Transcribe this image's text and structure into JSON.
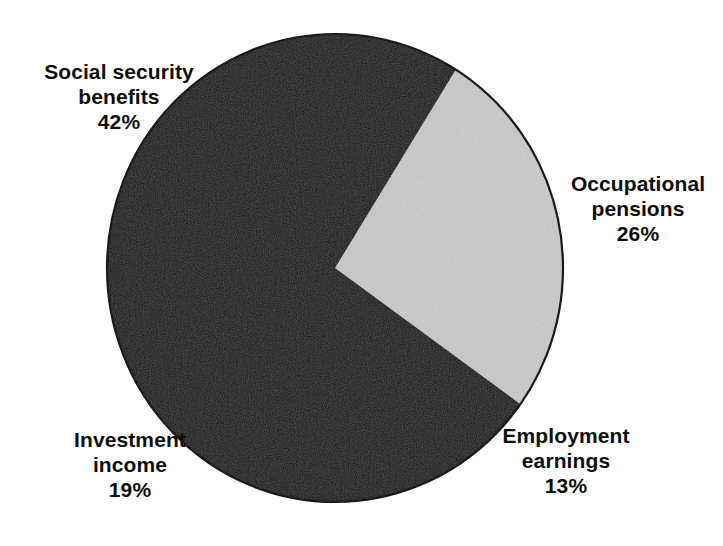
{
  "chart_data": {
    "type": "pie",
    "title": "",
    "subtitle": "",
    "xlabel": "",
    "ylabel": "",
    "legend_position": "none",
    "grid": false,
    "units": "percent",
    "total": 100,
    "start_angle_deg": 32,
    "direction": "clockwise",
    "categories": [
      "Occupational pensions",
      "Employment earnings",
      "Investment income",
      "Social security benefits"
    ],
    "values": [
      26,
      13,
      19,
      42
    ],
    "slices": [
      {
        "name": "occupational-pensions",
        "label_line1": "Occupational",
        "label_line2": "pensions",
        "value": 26,
        "value_label": "26%",
        "color": "#c9c9c9",
        "start_deg": 32,
        "end_deg": 125.6
      },
      {
        "name": "employment-earnings",
        "label_line1": "Employment",
        "label_line2": "earnings",
        "value": 13,
        "value_label": "13%",
        "color": "#111111",
        "start_deg": 125.6,
        "end_deg": 172.4
      },
      {
        "name": "investment-income",
        "label_line1": "Investment",
        "label_line2": "income",
        "value": 19,
        "value_label": "19%",
        "color": "#111111",
        "start_deg": 172.4,
        "end_deg": 240.8
      },
      {
        "name": "social-security-benefits",
        "label_line1": "Social security",
        "label_line2": "benefits",
        "value": 42,
        "value_label": "42%",
        "color": "#111111",
        "start_deg": 240.8,
        "end_deg": 392
      }
    ]
  },
  "colors": {
    "background": "#ffffff",
    "dark_slice": "#111111",
    "light_slice": "#c9c9c9",
    "outline": "#1a1a1a",
    "text": "#0d0d0d"
  },
  "geometry": {
    "center_x": 335,
    "center_y": 268,
    "radius_x": 228,
    "radius_y": 234
  }
}
